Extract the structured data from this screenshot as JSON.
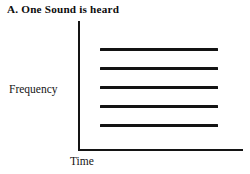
{
  "figure": {
    "caption_label": "A.",
    "caption_text": "One Sound is heard",
    "caption_full": "A. One Sound is heard"
  },
  "axes": {
    "y_label": "Frequency",
    "x_label": "Time"
  },
  "chart_data": {
    "type": "line",
    "xlabel": "Time",
    "ylabel": "Frequency",
    "grid": false,
    "legend": "none",
    "axis_style": "L-shaped spine, no tick marks, no tick labels",
    "xlim": [
      0,
      1
    ],
    "ylim": [
      0,
      1
    ],
    "series": [
      {
        "name": "harmonic-5",
        "y": 0.79,
        "x_start": 0.17,
        "x_end": 0.85
      },
      {
        "name": "harmonic-4",
        "y": 0.63,
        "x_start": 0.17,
        "x_end": 0.85
      },
      {
        "name": "harmonic-3",
        "y": 0.48,
        "x_start": 0.17,
        "x_end": 0.85
      },
      {
        "name": "harmonic-2",
        "y": 0.33,
        "x_start": 0.17,
        "x_end": 0.85
      },
      {
        "name": "harmonic-1",
        "y": 0.19,
        "x_start": 0.17,
        "x_end": 0.85
      }
    ],
    "line_count": 5,
    "line_color": "#131313",
    "background_color": "#ffffff"
  },
  "geometry": {
    "lines": [
      {
        "left": 100,
        "top": 48,
        "width": 118,
        "height": 3
      },
      {
        "left": 100,
        "top": 67,
        "width": 118,
        "height": 3
      },
      {
        "left": 100,
        "top": 86,
        "width": 118,
        "height": 3
      },
      {
        "left": 100,
        "top": 105,
        "width": 118,
        "height": 3
      },
      {
        "left": 100,
        "top": 124,
        "width": 118,
        "height": 3
      }
    ]
  }
}
